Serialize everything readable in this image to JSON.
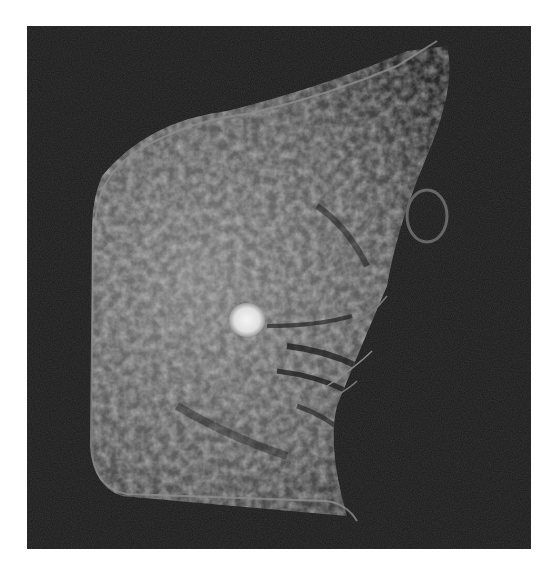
{
  "image": {
    "description": "Grayscale breast MRI axial slice showing fibroglandular tissue with a bright round enhancing mass",
    "colors": {
      "background": "#ffffff",
      "panel": "#1a1a1a",
      "tissue": "#8a8a8a",
      "lesion": "#eeeeee"
    }
  }
}
